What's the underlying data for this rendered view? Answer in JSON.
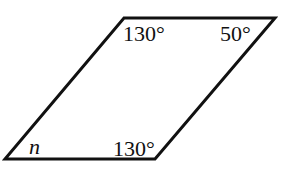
{
  "figure": {
    "type": "parallelogram",
    "stroke_color": "#111111",
    "vertices": {
      "top_left": [
        124,
        18
      ],
      "top_right": [
        275,
        18
      ],
      "bottom_right": [
        155,
        159
      ],
      "bottom_left": [
        5,
        159
      ]
    },
    "angle_labels": {
      "top_left": "130°",
      "top_right": "50°",
      "bottom_right": "130°",
      "bottom_left": "n"
    }
  }
}
